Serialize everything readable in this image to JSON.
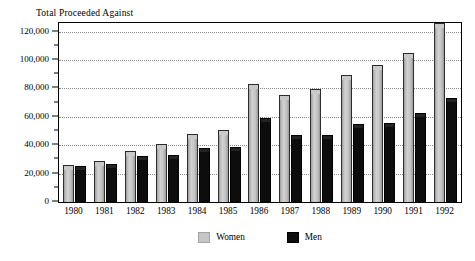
{
  "chart_data": {
    "type": "bar",
    "title": "Total Proceeded Against",
    "xlabel": "",
    "ylabel": "",
    "categories": [
      "1980",
      "1981",
      "1982",
      "1983",
      "1984",
      "1985",
      "1986",
      "1987",
      "1988",
      "1989",
      "1990",
      "1991",
      "1992"
    ],
    "series": [
      {
        "name": "Women",
        "color": "#c6c6c6",
        "values": [
          24000,
          27000,
          34000,
          39000,
          45500,
          48500,
          81000,
          73000,
          77500,
          87500,
          94000,
          103000,
          124000
        ]
      },
      {
        "name": "Men",
        "color": "#0d0d0d",
        "values": [
          24000,
          25500,
          31000,
          31500,
          36500,
          37000,
          58000,
          46000,
          46000,
          53500,
          54000,
          61000,
          71500
        ]
      }
    ],
    "ylim": [
      0,
      126000
    ],
    "ytick_values": [
      0,
      20000,
      40000,
      60000,
      80000,
      100000,
      120000
    ],
    "ytick_labels": [
      "0",
      "20,000",
      "40,000",
      "60,000",
      "80,000",
      "100,000",
      "120,000"
    ],
    "yminor_tick_values": [
      10000,
      30000,
      50000,
      70000,
      90000,
      110000
    ],
    "gridline_values": [
      20000,
      40000,
      60000,
      80000,
      100000,
      120000
    ],
    "grid": true,
    "grid_style": "dotted-horizontal",
    "legend_position": "bottom-center",
    "legend": [
      "Women",
      "Men"
    ]
  }
}
